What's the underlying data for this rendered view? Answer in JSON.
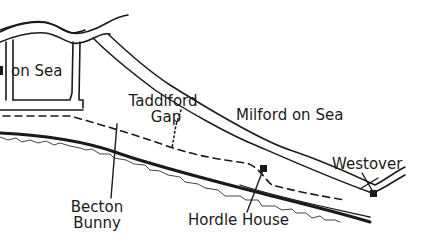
{
  "map": {
    "style": "hand-drawn coastal sketch map",
    "colors": {
      "ink": "#1a1a1a",
      "background": "#ffffff",
      "cliff_line": "#444444"
    },
    "labels": {
      "on_sea": "on Sea",
      "taddiford_line1": "Taddiford",
      "taddiford_line2": "Gap",
      "milford": "Milford on Sea",
      "westover": "Westover",
      "becton_line1": "Becton",
      "becton_line2": "Bunny",
      "hordle_house": "Hordle House"
    },
    "legend_features": {
      "road": "double-line road",
      "footpath": "dashed footpath",
      "gap_path": "dotted path at Taddiford Gap",
      "coastline": "thick shoreline",
      "cliff_edge": "jagged cliff line",
      "buildings": [
        "Hordle House marker",
        "Westover marker"
      ]
    }
  }
}
